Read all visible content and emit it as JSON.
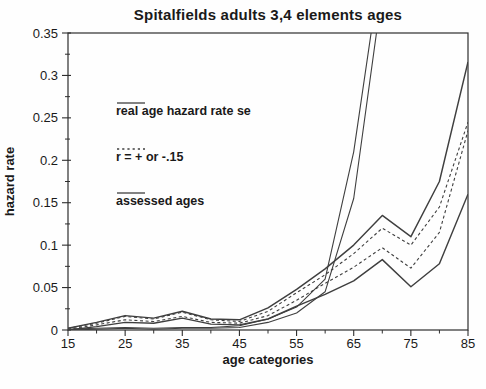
{
  "title": "Spitalfields adults 3,4 elements ages",
  "colors": {
    "line": "#3f3f3f",
    "axis": "#2e2e2e",
    "text": "#1a1a1a",
    "background": "#fefefe"
  },
  "axes": {
    "y_label": "hazard rate",
    "x_label": "age categories",
    "y_tick_labels": [
      "0",
      "0.05",
      "0.1",
      "0.15",
      "0.2",
      "0.25",
      "0.3",
      "0.35"
    ],
    "y_ticks": [
      0,
      0.05,
      0.1,
      0.15,
      0.2,
      0.25,
      0.3,
      0.35
    ],
    "y_minor_step": 0.025,
    "x_tick_labels": [
      "15",
      "25",
      "35",
      "45",
      "55",
      "65",
      "75",
      "85"
    ],
    "x_ticks": [
      15,
      25,
      35,
      45,
      55,
      65,
      75,
      85
    ],
    "x_minor_step": 5
  },
  "legend": [
    {
      "label": "real age hazard rate se",
      "style": "solid"
    },
    {
      "label": "r = + or -.15",
      "style": "dashed"
    },
    {
      "label": "assessed ages",
      "style": "solid"
    }
  ],
  "chart_data": {
    "type": "line",
    "title": "Spitalfields adults 3,4 elements ages",
    "xlabel": "age categories",
    "ylabel": "hazard rate",
    "xlim": [
      15,
      85
    ],
    "ylim": [
      0,
      0.35
    ],
    "grid": false,
    "legend_position": "upper-left-inside",
    "series": [
      {
        "id": "real-age-se-upper",
        "legend_label": "real age hazard rate se",
        "style": "solid",
        "x": [
          15,
          20,
          25,
          30,
          35,
          40,
          45,
          50,
          55,
          60,
          65,
          70
        ],
        "y": [
          0.001,
          0.002,
          0.003,
          0.002,
          0.003,
          0.003,
          0.005,
          0.013,
          0.027,
          0.06,
          0.21,
          0.44
        ]
      },
      {
        "id": "real-age-se-lower",
        "legend_label": "real age hazard rate se",
        "style": "solid",
        "x": [
          15,
          20,
          25,
          30,
          35,
          40,
          45,
          50,
          55,
          60,
          65,
          70
        ],
        "y": [
          0.0,
          0.001,
          0.002,
          0.001,
          0.002,
          0.002,
          0.003,
          0.009,
          0.02,
          0.045,
          0.155,
          0.4
        ]
      },
      {
        "id": "r-plus-015",
        "legend_label": "r = + or -.15",
        "style": "dashed",
        "x": [
          15,
          20,
          25,
          30,
          35,
          40,
          45,
          50,
          55,
          60,
          65,
          70,
          75,
          80,
          85
        ],
        "y": [
          0.002,
          0.008,
          0.016,
          0.013,
          0.021,
          0.012,
          0.01,
          0.022,
          0.044,
          0.065,
          0.09,
          0.12,
          0.1,
          0.145,
          0.245
        ]
      },
      {
        "id": "r-minus-015",
        "legend_label": "r = + or -.15",
        "style": "dashed",
        "x": [
          15,
          20,
          25,
          30,
          35,
          40,
          45,
          50,
          55,
          60,
          65,
          70,
          75,
          80,
          85
        ],
        "y": [
          0.001,
          0.006,
          0.012,
          0.01,
          0.016,
          0.009,
          0.008,
          0.017,
          0.035,
          0.055,
          0.074,
          0.097,
          0.073,
          0.115,
          0.235
        ]
      },
      {
        "id": "assessed-ages-upper",
        "legend_label": "assessed ages",
        "style": "solid-thick",
        "x": [
          15,
          20,
          25,
          30,
          35,
          40,
          45,
          50,
          55,
          60,
          65,
          70,
          75,
          80,
          85
        ],
        "y": [
          0.002,
          0.009,
          0.017,
          0.014,
          0.022,
          0.013,
          0.012,
          0.026,
          0.048,
          0.072,
          0.1,
          0.135,
          0.11,
          0.175,
          0.316
        ]
      },
      {
        "id": "assessed-ages-lower",
        "legend_label": "assessed ages",
        "style": "solid-thick",
        "x": [
          15,
          20,
          25,
          30,
          35,
          40,
          45,
          50,
          55,
          60,
          65,
          70,
          75,
          80,
          85
        ],
        "y": [
          0.0,
          0.004,
          0.009,
          0.008,
          0.014,
          0.007,
          0.006,
          0.013,
          0.028,
          0.042,
          0.058,
          0.083,
          0.051,
          0.078,
          0.16
        ]
      }
    ]
  }
}
